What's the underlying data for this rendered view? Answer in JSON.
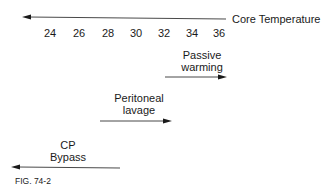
{
  "axis": {
    "title": "Core Temperature",
    "ticks": [
      "24",
      "26",
      "28",
      "30",
      "32",
      "34",
      "36"
    ],
    "direction": "decreasing-left"
  },
  "treatments": [
    {
      "label_line1": "Passive",
      "label_line2": "warming",
      "range": "36→",
      "arrow_direction": "right"
    },
    {
      "label_line1": "Peritoneal",
      "label_line2": "lavage",
      "range": "30→34",
      "arrow_direction": "right"
    },
    {
      "label_line1": "CP",
      "label_line2": "Bypass",
      "range": "←28",
      "arrow_direction": "left"
    }
  ],
  "figure_label": "FIG. 74-2",
  "colors": {
    "line": "#1a1a1a",
    "background": "#ffffff"
  }
}
